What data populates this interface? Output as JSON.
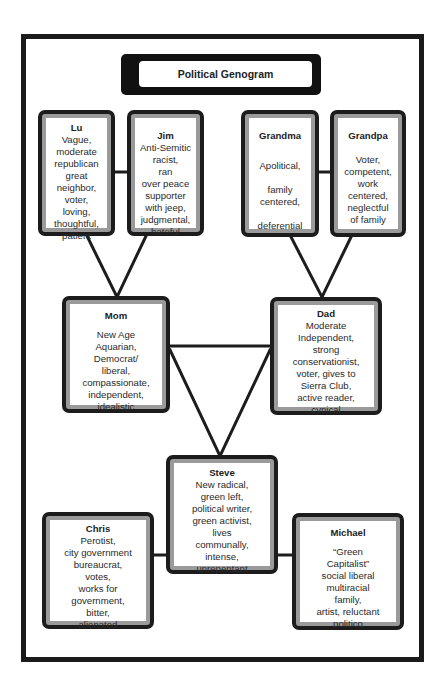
{
  "title": "Political Genogram",
  "people": {
    "lu": {
      "name": "Lu",
      "description": "Vague,\nmoderate\nrepublican\ngreat\nneighbor,\nvoter,\nloving,\nthoughtful,\npatient"
    },
    "jim": {
      "name": "Jim",
      "description": "Anti-Semitic\nracist,\nran\nover peace\nsupporter\nwith jeep,\njudgmental,\nhateful"
    },
    "grandma": {
      "name": "Grandma",
      "description": "Apolitical,\n\nfamily\ncentered,\n\ndeferential"
    },
    "grandpa": {
      "name": "Grandpa",
      "description": "Voter,\ncompetent,\nwork\ncentered,\nneglectful\nof family"
    },
    "mom": {
      "name": "Mom",
      "description": "New Age\nAquarian,\nDemocrat/\nliberal,\ncompassionate,\nindependent,\nidealistic"
    },
    "dad": {
      "name": "Dad",
      "description": "Moderate\nIndependent,\nstrong\nconservationist,\nvoter, gives to\nSierra Club,\nactive reader,\ncynical"
    },
    "steve": {
      "name": "Steve",
      "description": "New radical,\ngreen left,\npolitical writer,\ngreen activist,\nlives\ncommunally,\nintense,\nunrepentant"
    },
    "chris": {
      "name": "Chris",
      "description": "Perotist,\ncity government\nbureaucrat,\nvotes,\nworks for\ngovernment,\nbitter,\nalienated"
    },
    "michael": {
      "name": "Michael",
      "description": "“Green\nCapitalist”\nsocial liberal\nmultiracial\nfamily,\nartist, reluctant\npolitico"
    }
  },
  "colors": {
    "border": "#1c1c1c",
    "band": "#9a9a9a",
    "fill": "#ffffff"
  }
}
